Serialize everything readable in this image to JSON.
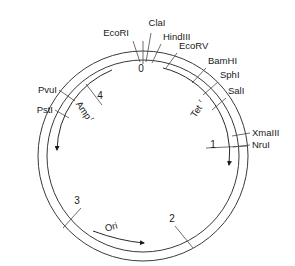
{
  "diagram": {
    "type": "plasmid-map",
    "title": "",
    "circle": {
      "center_x": 143,
      "center_y": 156,
      "outer_radius": 105,
      "inner_radius": 96,
      "stroke_color": "#3a3a3a"
    },
    "scale": {
      "unit": "kb",
      "total": 5,
      "tick_labels": [
        "0",
        "1",
        "2",
        "3",
        "4"
      ]
    },
    "ticks": [
      {
        "label": "0",
        "angle_deg": 0,
        "text_x": 141,
        "text_y": 72
      },
      {
        "label": "1",
        "angle_deg": 77,
        "text_x": 213,
        "text_y": 148
      },
      {
        "label": "2",
        "angle_deg": 150,
        "text_x": 172,
        "text_y": 222
      },
      {
        "label": "3",
        "angle_deg": 222,
        "text_x": 77,
        "text_y": 204
      },
      {
        "label": "4",
        "angle_deg": 307,
        "text_x": 100,
        "text_y": 99
      }
    ],
    "restriction_sites": [
      {
        "name": "EcoRI",
        "label_x": 129,
        "label_y": 36,
        "anchor": "end",
        "angle_deg": 355
      },
      {
        "name": "ClaI",
        "label_x": 157,
        "label_y": 26,
        "anchor": "middle",
        "angle_deg": 359
      },
      {
        "name": "HindIII",
        "label_x": 163,
        "label_y": 40,
        "anchor": "start",
        "angle_deg": 3
      },
      {
        "name": "EcoRV",
        "label_x": 179,
        "label_y": 49,
        "anchor": "start",
        "angle_deg": 12
      },
      {
        "name": "BamHI",
        "label_x": 208,
        "label_y": 64,
        "anchor": "start",
        "angle_deg": 25
      },
      {
        "name": "SphI",
        "label_x": 220,
        "label_y": 78,
        "anchor": "start",
        "angle_deg": 33
      },
      {
        "name": "SalI",
        "label_x": 228,
        "label_y": 94,
        "anchor": "start",
        "angle_deg": 41
      },
      {
        "name": "XmaIII",
        "label_x": 252,
        "label_y": 136,
        "anchor": "start",
        "angle_deg": 66
      },
      {
        "name": "NruI",
        "label_x": 252,
        "label_y": 148,
        "anchor": "start",
        "angle_deg": 72
      },
      {
        "name": "PvuI",
        "label_x": 57,
        "label_y": 93,
        "anchor": "end",
        "angle_deg": 312
      },
      {
        "name": "PstI",
        "label_x": 53,
        "label_y": 113,
        "anchor": "end",
        "angle_deg": 303
      }
    ],
    "genes": [
      {
        "name": "Amp",
        "superscript": "r",
        "label_x": 81,
        "label_y": 112,
        "rotation_deg": 56,
        "arc_start_deg": 330,
        "arc_end_deg": 246,
        "direction": "counterclockwise"
      },
      {
        "name": "Tet",
        "superscript": "r",
        "label_x": 199,
        "label_y": 113,
        "rotation_deg": -57,
        "arc_start_deg": 14,
        "arc_end_deg": 100,
        "direction": "clockwise"
      }
    ],
    "origin": {
      "name": "Ori",
      "label_x": 112,
      "label_y": 230,
      "rotation_deg": -16,
      "arrow_from_x": 93,
      "arrow_from_y": 232,
      "arrow_to_x": 146,
      "arrow_to_y": 243
    }
  }
}
